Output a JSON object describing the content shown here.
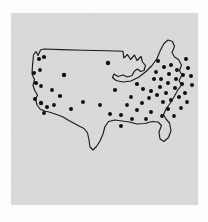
{
  "figure": {
    "kind": "scanned-dot-distribution-map",
    "title": "",
    "caption": "",
    "background_color": "#fdfdfd",
    "paper_color": "#dcdcdc",
    "outline_color": "#1b1b1b",
    "dot_color": "#0d0d0d",
    "dot_count": 62,
    "panel": {
      "x": 11,
      "y": 13,
      "width": 187,
      "height": 192
    }
  },
  "map": {
    "name": "united-states-outline",
    "projection_note": "hand-traced national border, no state boundaries",
    "features": [
      "west-coast",
      "northern-border",
      "great-lakes",
      "maine-peak",
      "florida-peninsula",
      "texas-gulf-coast",
      "baja-southern-california-corner"
    ],
    "outline_path": "M 66 31 L 66 25 L 69 22 L 72 26 L 74 23 L 76 27 L 80 25 L 96 25 L 118 26 L 140 27 L 162 28 L 176 28 L 176 34 L 179 31 L 182 35 L 185 31 L 188 36 L 191 33 L 194 38 L 199 36 L 204 41 L 211 43 L 216 41 L 220 46 L 226 44 L 232 48 L 238 45 L 243 50 L 250 47",
    "dots": [
      {
        "id": "d01",
        "x": 28,
        "y": 46,
        "r": 2.0,
        "region": "pacific-northwest"
      },
      {
        "id": "d02",
        "x": 33,
        "y": 44,
        "r": 2.1,
        "region": "pacific-northwest"
      },
      {
        "id": "d03",
        "x": 23,
        "y": 60,
        "r": 2.0,
        "region": "northern-california"
      },
      {
        "id": "d04",
        "x": 29,
        "y": 57,
        "r": 1.9,
        "region": "northern-california"
      },
      {
        "id": "d05",
        "x": 25,
        "y": 70,
        "r": 2.1,
        "region": "california"
      },
      {
        "id": "d06",
        "x": 30,
        "y": 73,
        "r": 1.9,
        "region": "california"
      },
      {
        "id": "d07",
        "x": 24,
        "y": 86,
        "r": 2.0,
        "region": "southern-california"
      },
      {
        "id": "d08",
        "x": 30,
        "y": 90,
        "r": 2.2,
        "region": "southern-california"
      },
      {
        "id": "d09",
        "x": 36,
        "y": 94,
        "r": 2.0,
        "region": "southern-california"
      },
      {
        "id": "d10",
        "x": 33,
        "y": 100,
        "r": 1.9,
        "region": "southern-california"
      },
      {
        "id": "d11",
        "x": 53,
        "y": 62,
        "r": 2.2,
        "region": "mountain-west"
      },
      {
        "id": "d12",
        "x": 49,
        "y": 83,
        "r": 2.1,
        "region": "southwest"
      },
      {
        "id": "d13",
        "x": 60,
        "y": 96,
        "r": 2.0,
        "region": "southwest"
      },
      {
        "id": "d14",
        "x": 72,
        "y": 89,
        "r": 2.0,
        "region": "southwest"
      },
      {
        "id": "d15",
        "x": 97,
        "y": 50,
        "r": 2.2,
        "region": "northern-plains"
      },
      {
        "id": "d16",
        "x": 104,
        "y": 77,
        "r": 2.1,
        "region": "central-plains"
      },
      {
        "id": "d17",
        "x": 99,
        "y": 101,
        "r": 2.0,
        "region": "southern-plains"
      },
      {
        "id": "d18",
        "x": 110,
        "y": 102,
        "r": 2.0,
        "region": "southern-plains"
      },
      {
        "id": "d19",
        "x": 110,
        "y": 113,
        "r": 2.0,
        "region": "texas"
      },
      {
        "id": "d20",
        "x": 126,
        "y": 71,
        "r": 2.1,
        "region": "midwest"
      },
      {
        "id": "d21",
        "x": 131,
        "y": 90,
        "r": 2.0,
        "region": "mid-south"
      },
      {
        "id": "d22",
        "x": 126,
        "y": 97,
        "r": 2.0,
        "region": "mid-south"
      },
      {
        "id": "d23",
        "x": 140,
        "y": 99,
        "r": 2.0,
        "region": "southeast"
      },
      {
        "id": "d24",
        "x": 135,
        "y": 106,
        "r": 1.9,
        "region": "southeast"
      },
      {
        "id": "d25",
        "x": 143,
        "y": 66,
        "r": 2.0,
        "region": "great-lakes"
      },
      {
        "id": "d26",
        "x": 132,
        "y": 76,
        "r": 2.0,
        "region": "great-lakes"
      },
      {
        "id": "d27",
        "x": 140,
        "y": 78,
        "r": 2.0,
        "region": "great-lakes"
      },
      {
        "id": "d28",
        "x": 149,
        "y": 74,
        "r": 2.0,
        "region": "great-lakes"
      },
      {
        "id": "d29",
        "x": 146,
        "y": 82,
        "r": 2.0,
        "region": "ohio-valley"
      },
      {
        "id": "d30",
        "x": 155,
        "y": 80,
        "r": 2.0,
        "region": "ohio-valley"
      },
      {
        "id": "d31",
        "x": 152,
        "y": 89,
        "r": 2.0,
        "region": "appalachia"
      },
      {
        "id": "d32",
        "x": 160,
        "y": 87,
        "r": 2.0,
        "region": "appalachia"
      },
      {
        "id": "d33",
        "x": 157,
        "y": 96,
        "r": 2.0,
        "region": "southeast"
      },
      {
        "id": "d34",
        "x": 151,
        "y": 103,
        "r": 1.9,
        "region": "southeast"
      },
      {
        "id": "d35",
        "x": 147,
        "y": 48,
        "r": 2.0,
        "region": "northeast"
      },
      {
        "id": "d36",
        "x": 153,
        "y": 54,
        "r": 2.0,
        "region": "northeast"
      },
      {
        "id": "d37",
        "x": 160,
        "y": 52,
        "r": 2.0,
        "region": "northeast"
      },
      {
        "id": "d38",
        "x": 166,
        "y": 57,
        "r": 2.0,
        "region": "northeast"
      },
      {
        "id": "d39",
        "x": 158,
        "y": 61,
        "r": 2.0,
        "region": "northeast"
      },
      {
        "id": "d40",
        "x": 165,
        "y": 66,
        "r": 2.0,
        "region": "northeast"
      },
      {
        "id": "d41",
        "x": 172,
        "y": 62,
        "r": 2.0,
        "region": "northeast"
      },
      {
        "id": "d42",
        "x": 171,
        "y": 71,
        "r": 2.0,
        "region": "northeast"
      },
      {
        "id": "d43",
        "x": 164,
        "y": 75,
        "r": 2.0,
        "region": "northeast"
      },
      {
        "id": "d44",
        "x": 157,
        "y": 70,
        "r": 2.0,
        "region": "northeast"
      },
      {
        "id": "d45",
        "x": 150,
        "y": 66,
        "r": 2.0,
        "region": "northeast"
      },
      {
        "id": "d46",
        "x": 177,
        "y": 55,
        "r": 2.0,
        "region": "new-england"
      },
      {
        "id": "d47",
        "x": 180,
        "y": 63,
        "r": 2.0,
        "region": "new-england"
      },
      {
        "id": "d48",
        "x": 175,
        "y": 46,
        "r": 2.0,
        "region": "maine"
      },
      {
        "id": "d49",
        "x": 181,
        "y": 72,
        "r": 2.0,
        "region": "new-england"
      },
      {
        "id": "d50",
        "x": 174,
        "y": 80,
        "r": 2.0,
        "region": "mid-atlantic"
      },
      {
        "id": "d51",
        "x": 168,
        "y": 84,
        "r": 2.0,
        "region": "mid-atlantic"
      },
      {
        "id": "d52",
        "x": 176,
        "y": 89,
        "r": 1.9,
        "region": "mid-atlantic"
      },
      {
        "id": "d53",
        "x": 170,
        "y": 95,
        "r": 1.9,
        "region": "mid-atlantic"
      },
      {
        "id": "d54",
        "x": 163,
        "y": 103,
        "r": 1.9,
        "region": "southeast-coast"
      },
      {
        "id": "d55",
        "x": 145,
        "y": 59,
        "r": 1.9,
        "region": "great-lakes"
      },
      {
        "id": "d56",
        "x": 138,
        "y": 85,
        "r": 1.9,
        "region": "ohio-valley"
      },
      {
        "id": "d57",
        "x": 120,
        "y": 84,
        "r": 1.9,
        "region": "midwest"
      },
      {
        "id": "d58",
        "x": 116,
        "y": 92,
        "r": 1.9,
        "region": "mid-south"
      },
      {
        "id": "d59",
        "x": 41,
        "y": 77,
        "r": 1.9,
        "region": "great-basin"
      },
      {
        "id": "d60",
        "x": 43,
        "y": 92,
        "r": 1.9,
        "region": "southwest"
      },
      {
        "id": "d61",
        "x": 89,
        "y": 92,
        "r": 1.9,
        "region": "southern-plains"
      },
      {
        "id": "d62",
        "x": 121,
        "y": 106,
        "r": 1.9,
        "region": "texas-gulf"
      }
    ]
  }
}
